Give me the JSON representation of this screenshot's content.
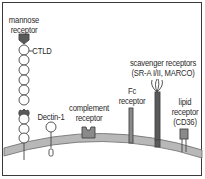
{
  "diagram": {
    "type": "cell-surface-receptors",
    "receptors": [
      {
        "id": "mannose",
        "label_line1": "mannose",
        "label_line2": "receptor",
        "sublabel": "CTLD"
      },
      {
        "id": "dectin",
        "label": "Dectin-1"
      },
      {
        "id": "complement",
        "label_line1": "complement",
        "label_line2": "receptor"
      },
      {
        "id": "fc",
        "label_line1": "Fc",
        "label_line2": "receptor"
      },
      {
        "id": "scavenger",
        "label_line1": "scavenger receptors",
        "label_line2": "(SR-A I/II, MARCO)"
      },
      {
        "id": "lipid",
        "label_line1": "lipid",
        "label_line2": "receptor",
        "label_line3": "(CD36)"
      }
    ],
    "colors": {
      "membrane": "#b8b8b8",
      "membrane_edge": "#6a6a6a",
      "dark_domain": "#5a5a5a",
      "light_domain": "#ffffff",
      "receptor_fill": "#8a8a8a",
      "frame": "#3a3a3a"
    }
  }
}
